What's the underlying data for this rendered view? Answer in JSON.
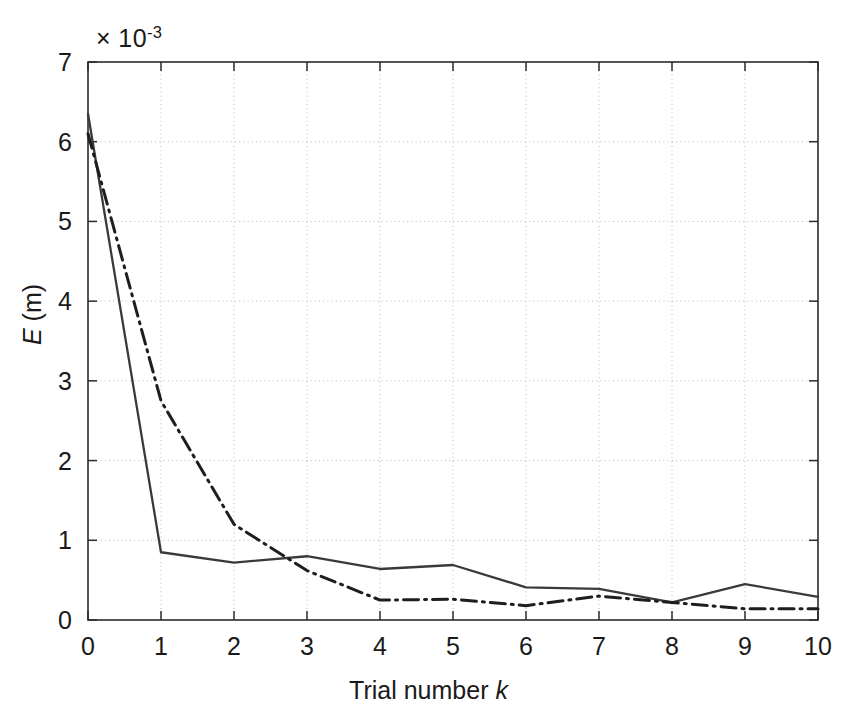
{
  "chart_data": {
    "type": "line",
    "title": "",
    "xlabel": "Trial number k",
    "ylabel": "E (m)",
    "y_multiplier": "× 10",
    "y_multiplier_exponent": "-3",
    "y_multiplier_text": "× 10⁻³",
    "xlim": [
      0,
      10
    ],
    "ylim": [
      0,
      7
    ],
    "xticks": [
      0,
      1,
      2,
      3,
      4,
      5,
      6,
      7,
      8,
      9,
      10
    ],
    "yticks": [
      0,
      1,
      2,
      3,
      4,
      5,
      6,
      7
    ],
    "xtick_labels": [
      "0",
      "1",
      "2",
      "3",
      "4",
      "5",
      "6",
      "7",
      "8",
      "9",
      "10"
    ],
    "ytick_labels": [
      "0",
      "1",
      "2",
      "3",
      "4",
      "5",
      "6",
      "7"
    ],
    "grid": true,
    "grid_style": "dotted",
    "legend": null,
    "legend_position": "none",
    "x": [
      0,
      1,
      2,
      3,
      4,
      5,
      6,
      7,
      8,
      9,
      10
    ],
    "series": [
      {
        "name": "solid",
        "style": "solid",
        "color": "#3a3a3a",
        "values": [
          6.35,
          0.85,
          0.72,
          0.8,
          0.64,
          0.69,
          0.41,
          0.39,
          0.22,
          0.45,
          0.29
        ]
      },
      {
        "name": "dash-dot",
        "style": "dashdot",
        "color": "#1e1e1e",
        "values": [
          6.1,
          2.75,
          1.2,
          0.62,
          0.25,
          0.26,
          0.18,
          0.3,
          0.22,
          0.14,
          0.14
        ]
      }
    ]
  },
  "axes": {
    "exponent_prefix": "× 10",
    "exponent_power": "-3",
    "xlabel_prefix": "Trial number ",
    "xlabel_italic": "k",
    "ylabel_italic": "E",
    "ylabel_suffix": " (m)"
  },
  "colors": {
    "background": "#ffffff",
    "axis": "#2b2b2b",
    "grid": "#b9b9b9",
    "series_solid": "#3a3a3a",
    "series_dashdot": "#1e1e1e",
    "text": "#1a1a1a"
  }
}
